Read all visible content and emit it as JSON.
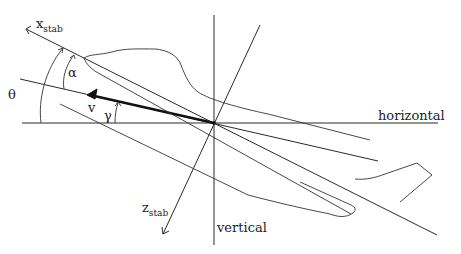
{
  "diagram": {
    "axes": {
      "x_stab": {
        "main": "x",
        "sub": "stab"
      },
      "z_stab": {
        "main": "z",
        "sub": "stab"
      },
      "horizontal": "horizontal",
      "vertical": "vertical"
    },
    "angles": {
      "alpha": "α",
      "theta": "θ",
      "gamma": "γ"
    },
    "vectors": {
      "velocity": "v"
    },
    "colors": {
      "line": "#2a2a2a",
      "background": "#ffffff"
    }
  }
}
